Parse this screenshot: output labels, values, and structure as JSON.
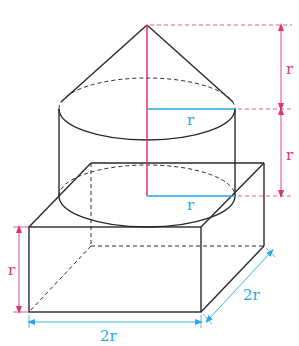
{
  "colors": {
    "edge": "#2a2a2a",
    "axis": "#e0336a",
    "radius": "#29a9e0",
    "dimension_pink": "#e0336a",
    "dimension_blue": "#29a9e0"
  },
  "labels": {
    "cone_height": "r",
    "cylinder_height": "r",
    "cone_radius": "r",
    "cylinder_radius": "r",
    "box_height": "r",
    "box_width": "2r",
    "box_depth": "2r"
  }
}
